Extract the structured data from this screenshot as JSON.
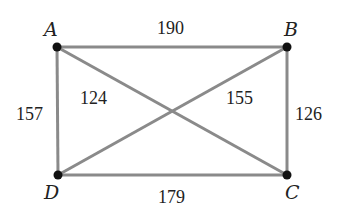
{
  "diagram": {
    "type": "weighted-complete-graph",
    "vertices": [
      {
        "id": "A",
        "label": "A"
      },
      {
        "id": "B",
        "label": "B"
      },
      {
        "id": "C",
        "label": "C"
      },
      {
        "id": "D",
        "label": "D"
      }
    ],
    "edges": [
      {
        "from": "A",
        "to": "B",
        "weight": "190"
      },
      {
        "from": "B",
        "to": "C",
        "weight": "126"
      },
      {
        "from": "D",
        "to": "C",
        "weight": "179"
      },
      {
        "from": "A",
        "to": "D",
        "weight": "157"
      },
      {
        "from": "A",
        "to": "C",
        "weight": "124"
      },
      {
        "from": "B",
        "to": "D",
        "weight": "155"
      }
    ],
    "colors": {
      "edge": "#8a8a8a",
      "vertex": "#111111",
      "text": "#222222"
    }
  }
}
